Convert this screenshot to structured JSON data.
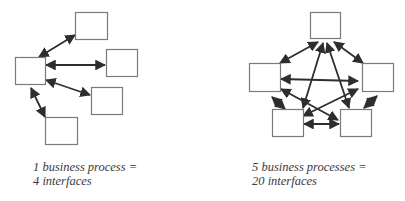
{
  "left_diagram": {
    "caption_line1": "1 business process =",
    "caption_line2": "4 interfaces",
    "boxes": [
      {
        "id": "center",
        "x": 15,
        "y": 57,
        "w": 30,
        "h": 27
      },
      {
        "id": "top",
        "x": 75,
        "y": 12,
        "w": 32,
        "h": 27
      },
      {
        "id": "right",
        "x": 106,
        "y": 49,
        "w": 31,
        "h": 27
      },
      {
        "id": "mid-right",
        "x": 91,
        "y": 87,
        "w": 31,
        "h": 27
      },
      {
        "id": "bottom",
        "x": 45,
        "y": 117,
        "w": 32,
        "h": 27
      }
    ],
    "arrows": [
      {
        "x1": 39,
        "y1": 57,
        "x2": 75,
        "y2": 35
      },
      {
        "x1": 46,
        "y1": 65,
        "x2": 105,
        "y2": 65
      },
      {
        "x1": 46,
        "y1": 80,
        "x2": 90,
        "y2": 95
      },
      {
        "x1": 31,
        "y1": 88,
        "x2": 45,
        "y2": 117
      }
    ]
  },
  "right_diagram": {
    "caption_line1": "5 business processes =",
    "caption_line2": "20 interfaces",
    "boxes": [
      {
        "id": "top",
        "x": 310,
        "y": 12,
        "w": 30,
        "h": 26
      },
      {
        "id": "left",
        "x": 249,
        "y": 63,
        "w": 31,
        "h": 28
      },
      {
        "id": "right",
        "x": 362,
        "y": 63,
        "w": 31,
        "h": 28
      },
      {
        "id": "bottom-left",
        "x": 272,
        "y": 109,
        "w": 31,
        "h": 27
      },
      {
        "id": "bottom-right",
        "x": 340,
        "y": 109,
        "w": 31,
        "h": 27
      }
    ],
    "arrows": [
      {
        "x1": 280,
        "y1": 63,
        "x2": 318,
        "y2": 42
      },
      {
        "x1": 334,
        "y1": 42,
        "x2": 363,
        "y2": 63
      },
      {
        "x1": 281,
        "y1": 79,
        "x2": 358,
        "y2": 81
      },
      {
        "x1": 281,
        "y1": 89,
        "x2": 338,
        "y2": 120
      },
      {
        "x1": 303,
        "y1": 116,
        "x2": 358,
        "y2": 89
      },
      {
        "x1": 323,
        "y1": 43,
        "x2": 303,
        "y2": 108
      },
      {
        "x1": 327,
        "y1": 43,
        "x2": 349,
        "y2": 108
      },
      {
        "x1": 272,
        "y1": 97,
        "x2": 285,
        "y2": 109
      },
      {
        "x1": 377,
        "y1": 96,
        "x2": 364,
        "y2": 108
      },
      {
        "x1": 304,
        "y1": 124,
        "x2": 339,
        "y2": 124
      }
    ]
  },
  "colors": {
    "box_stroke": "#7a7a7a",
    "arrow": "#2e2e2e",
    "text": "#3a3a3a"
  }
}
